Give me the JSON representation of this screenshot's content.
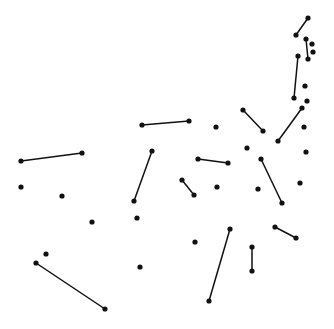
{
  "canvas": {
    "width": 334,
    "height": 329,
    "background": "#ffffff",
    "ink": "#111111"
  },
  "segments": [
    [
      308,
      18,
      296,
      35
    ],
    [
      306,
      39,
      308,
      59
    ],
    [
      298,
      56,
      294,
      98
    ],
    [
      302,
      108,
      278,
      141
    ],
    [
      243,
      110,
      263,
      131
    ],
    [
      21,
      161,
      82,
      153
    ],
    [
      142,
      125,
      189,
      121
    ],
    [
      152,
      151,
      134,
      201
    ],
    [
      198,
      159,
      228,
      163
    ],
    [
      261,
      159,
      282,
      203
    ],
    [
      182,
      180,
      194,
      195
    ],
    [
      275,
      227,
      296,
      238
    ],
    [
      36,
      263,
      105,
      309
    ],
    [
      230,
      229,
      209,
      301
    ],
    [
      252,
      247,
      252,
      271
    ]
  ],
  "dots": [
    [
      312,
      44
    ],
    [
      313,
      52
    ],
    [
      305,
      86
    ],
    [
      307,
      101
    ],
    [
      304,
      127
    ],
    [
      216,
      127
    ],
    [
      247,
      148
    ],
    [
      306,
      152
    ],
    [
      21,
      187
    ],
    [
      62,
      196
    ],
    [
      300,
      183
    ],
    [
      217,
      187
    ],
    [
      258,
      189
    ],
    [
      92,
      222
    ],
    [
      137,
      218
    ],
    [
      46,
      254
    ],
    [
      140,
      267
    ],
    [
      195,
      242
    ]
  ]
}
